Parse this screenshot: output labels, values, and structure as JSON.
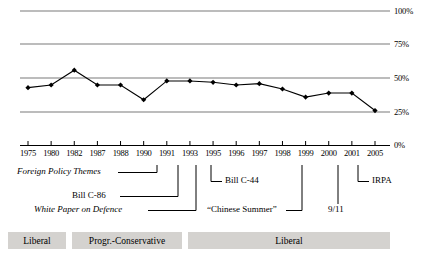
{
  "chart_data": {
    "type": "line",
    "title": "",
    "subtitle": "",
    "xlabel": "",
    "ylabel": "",
    "grid": true,
    "legend": "none",
    "ylim": [
      0,
      100
    ],
    "yticks": [
      "0%",
      "25%",
      "50%",
      "75%",
      "100%"
    ],
    "ytick_values": [
      0,
      25,
      50,
      75,
      100
    ],
    "categories": [
      "1975",
      "1980",
      "1982",
      "1987",
      "1988",
      "1990",
      "1991",
      "1993",
      "1995",
      "1996",
      "1997",
      "1998",
      "1999",
      "2000",
      "2001",
      "2005"
    ],
    "series": [
      {
        "name": "Share",
        "values": [
          43,
          45,
          56,
          45,
          45,
          34,
          48,
          48,
          47,
          45,
          46,
          42,
          36,
          39,
          39,
          26
        ],
        "marker": "diamond",
        "color": "#000000"
      }
    ]
  },
  "yaxis": {
    "ticks": [
      {
        "label": "100%",
        "value": 100
      },
      {
        "label": "75%",
        "value": 75
      },
      {
        "label": "50%",
        "value": 50
      },
      {
        "label": "25%",
        "value": 25
      },
      {
        "label": "0%",
        "value": 0
      }
    ]
  },
  "xaxis": {
    "ticks": [
      "1975",
      "1980",
      "1982",
      "1987",
      "1988",
      "1990",
      "1991",
      "1993",
      "1995",
      "1996",
      "1997",
      "1998",
      "1999",
      "2000",
      "2001",
      "2005"
    ]
  },
  "annotations": [
    {
      "id": "foreign-policy-themes",
      "label": "Foreign Policy Themes",
      "style": "italic"
    },
    {
      "id": "bill-c-86",
      "label": "Bill C-86",
      "style": "normal"
    },
    {
      "id": "white-paper-on-defence",
      "label": "White Paper on Defence",
      "style": "italic"
    },
    {
      "id": "bill-c-44",
      "label": "Bill C-44",
      "style": "normal"
    },
    {
      "id": "chinese-summer",
      "label": "“Chinese Summer”",
      "style": "normal"
    },
    {
      "id": "nine-eleven",
      "label": "9/11",
      "style": "normal"
    },
    {
      "id": "irpa",
      "label": "IRPA",
      "style": "normal"
    }
  ],
  "party_bars": [
    {
      "id": "liberal-1",
      "label": "Liberal"
    },
    {
      "id": "progressive-conservative",
      "label": "Progr.-Conservative"
    },
    {
      "id": "liberal-2",
      "label": "Liberal"
    }
  ],
  "colors": {
    "line": "#000000",
    "marker": "#000000",
    "gridline": "#808080",
    "axis": "#000000",
    "party_bar_fill": "#d4d2cf",
    "background": "#ffffff"
  }
}
